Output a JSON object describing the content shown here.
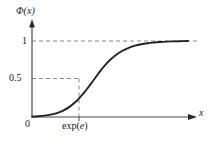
{
  "chart_data": {
    "type": "line",
    "title": "",
    "xlabel": "x",
    "ylabel": "Φ(x)",
    "x_tick_labels": [
      "0",
      "exp(e)"
    ],
    "y_tick_labels": [
      "0",
      "0.5",
      "1"
    ],
    "ylim": [
      0,
      1.08
    ],
    "xlim": [
      0,
      1.0
    ],
    "grid": false,
    "legend": null,
    "annotations": [
      {
        "name": "horizontal-asymptote",
        "value": 1,
        "style": "dashed"
      },
      {
        "name": "median-line",
        "value": 0.5,
        "style": "dashed"
      },
      {
        "name": "median-x-line",
        "label": "exp(e)",
        "style": "dashed"
      }
    ],
    "series": [
      {
        "name": "Φ(x)",
        "style": "solid",
        "color": "#222222",
        "x": [
          0.0,
          0.04,
          0.08,
          0.12,
          0.16,
          0.2,
          0.24,
          0.28,
          0.3,
          0.32,
          0.34,
          0.36,
          0.38,
          0.4,
          0.42,
          0.44,
          0.46,
          0.48,
          0.5,
          0.54,
          0.58,
          0.62,
          0.66,
          0.7,
          0.74,
          0.78,
          0.82,
          0.86,
          0.9,
          0.94,
          1.0
        ],
        "y": [
          0.005,
          0.01,
          0.018,
          0.031,
          0.052,
          0.085,
          0.133,
          0.2,
          0.241,
          0.287,
          0.336,
          0.389,
          0.443,
          0.5,
          0.556,
          0.61,
          0.661,
          0.708,
          0.75,
          0.82,
          0.872,
          0.91,
          0.938,
          0.957,
          0.971,
          0.98,
          0.987,
          0.992,
          0.995,
          0.997,
          1.0
        ]
      }
    ]
  },
  "labels": {
    "y_axis": "Φ(x)",
    "x_axis": "x",
    "origin": "0",
    "y_tick_one": "1",
    "y_tick_half": "0.5",
    "x_tick_expe_prefix": "exp(",
    "x_tick_expe_var": "e",
    "x_tick_expe_suffix": ")"
  },
  "colors": {
    "curve": "#222222",
    "axis": "#4a4a4a",
    "dashed": "#8a8a8a",
    "text": "#1a1a1a",
    "background": "#ffffff"
  }
}
